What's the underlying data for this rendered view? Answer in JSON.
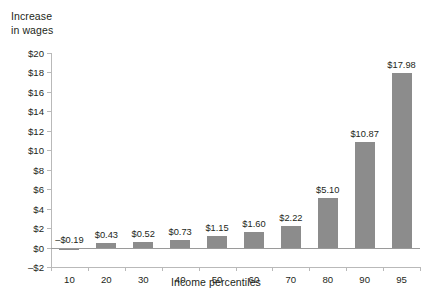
{
  "chart_data": {
    "type": "bar",
    "xlabel": "Income percentiles",
    "ylabel": "Increase in wages",
    "categories": [
      "10",
      "20",
      "30",
      "40",
      "50",
      "60",
      "70",
      "80",
      "90",
      "95"
    ],
    "values": [
      -0.19,
      0.43,
      0.52,
      0.73,
      1.15,
      1.6,
      2.22,
      5.1,
      10.87,
      17.98
    ],
    "data_labels": [
      "–$0.19",
      "$0.43",
      "$0.52",
      "$0.73",
      "$1.15",
      "$1.60",
      "$2.22",
      "$5.10",
      "$10.87",
      "$17.98"
    ],
    "ylim": [
      -2,
      20
    ],
    "ytick_values": [
      -2,
      0,
      2,
      4,
      6,
      8,
      10,
      12,
      14,
      16,
      18,
      20
    ],
    "ytick_labels": [
      "–$2",
      "$0",
      "$2",
      "$4",
      "$6",
      "$8",
      "$10",
      "$12",
      "$14",
      "$16",
      "$18",
      "$20"
    ],
    "grid": false,
    "legend": false,
    "bar_color": "#8c8c8c",
    "axis_color": "#b9b9b9",
    "text_color": "#231f20"
  },
  "axes": {
    "y_caption_line1": "Increase",
    "y_caption_line2": "in wages",
    "x_title": "Income percentiles"
  }
}
